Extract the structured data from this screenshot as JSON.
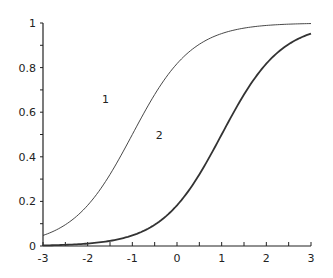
{
  "chart_data": {
    "type": "line",
    "title": "",
    "xlabel": "",
    "ylabel": "",
    "xlim": [
      -3,
      3
    ],
    "ylim": [
      0,
      1
    ],
    "grid": false,
    "legend": "none",
    "x_ticks": [
      "-3",
      "-2",
      "-1",
      "0",
      "1",
      "2",
      "3"
    ],
    "y_ticks": [
      "0",
      "0.2",
      "0.4",
      "0.6",
      "0.8",
      "1"
    ],
    "x": [
      -3,
      -2.5,
      -2,
      -1.5,
      -1,
      -0.5,
      0,
      0.5,
      1,
      1.5,
      2,
      2.5,
      3
    ],
    "series": [
      {
        "name": "1",
        "style": "thin",
        "values": [
          0.05,
          0.1,
          0.18,
          0.32,
          0.5,
          0.68,
          0.82,
          0.9,
          0.95,
          0.98,
          0.99,
          0.995,
          1.0
        ]
      },
      {
        "name": "2",
        "style": "thick",
        "values": [
          0.0,
          0.005,
          0.01,
          0.02,
          0.05,
          0.1,
          0.18,
          0.32,
          0.5,
          0.68,
          0.82,
          0.9,
          0.95
        ]
      }
    ],
    "annotations": [
      {
        "text": "1",
        "x": -1.6,
        "y": 0.66
      },
      {
        "text": "2",
        "x": -0.4,
        "y": 0.5
      }
    ]
  }
}
